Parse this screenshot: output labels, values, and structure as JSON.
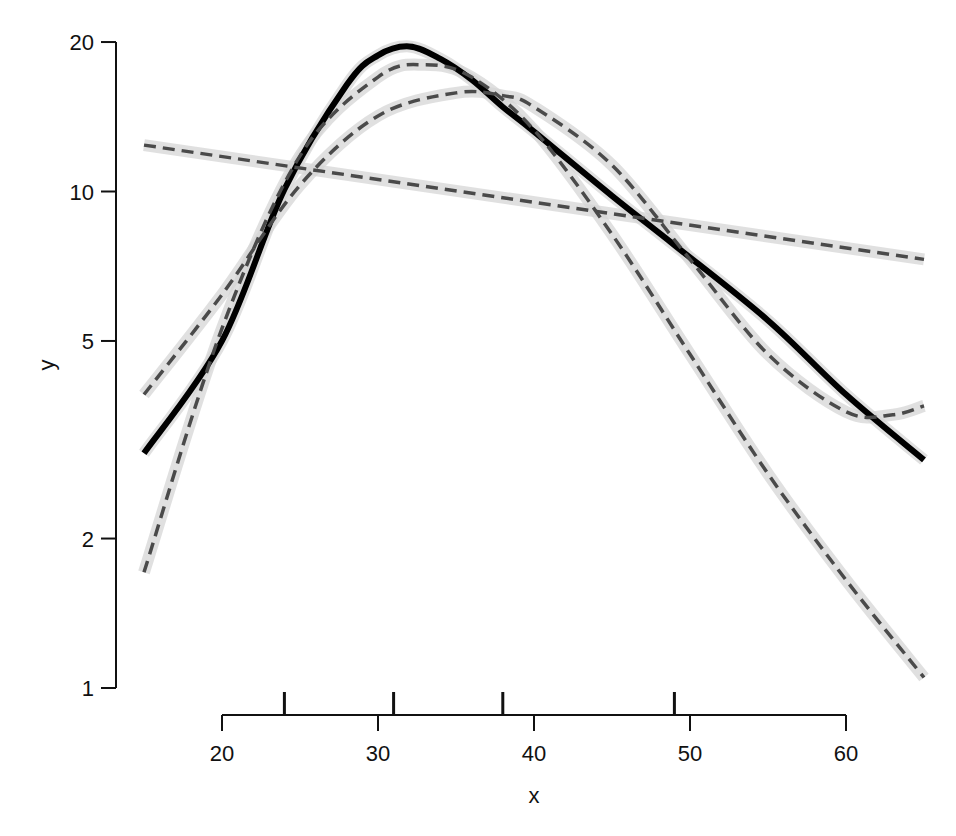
{
  "chart_data": {
    "type": "line",
    "title": "",
    "xlabel": "x",
    "ylabel": "y",
    "yscale": "log",
    "xlim": [
      15,
      65
    ],
    "ylim": [
      1,
      20
    ],
    "grid": false,
    "legend": null,
    "x_ticks": [
      20,
      30,
      40,
      50,
      60
    ],
    "y_ticks": [
      1,
      2,
      5,
      10,
      20
    ],
    "x_tick_labels": [
      "20",
      "30",
      "40",
      "50",
      "60"
    ],
    "y_tick_labels": [
      "1",
      "2",
      "5",
      "10",
      "20"
    ],
    "knot_marks": [
      24,
      31,
      38,
      49
    ],
    "series": [
      {
        "name": "spline (solid)",
        "style": "solid",
        "color": "#000000",
        "band": true,
        "x": [
          15,
          20,
          24,
          28,
          30,
          32,
          34,
          36,
          38,
          40,
          45,
          49,
          55,
          60,
          65
        ],
        "values": [
          2.97,
          5.0,
          10.1,
          16.4,
          18.8,
          19.6,
          18.5,
          16.8,
          14.8,
          13.2,
          9.8,
          7.8,
          5.5,
          3.9,
          2.88
        ]
      },
      {
        "name": "linear (dashed)",
        "style": "dashed",
        "color": "#4a4a4a",
        "band": true,
        "x": [
          15,
          65
        ],
        "values": [
          12.4,
          7.3
        ]
      },
      {
        "name": "quadratic (dashed)",
        "style": "dashed",
        "color": "#4a4a4a",
        "band": true,
        "x": [
          15,
          20,
          25,
          30,
          35,
          38,
          40,
          45,
          50,
          55,
          60,
          63,
          65
        ],
        "values": [
          3.9,
          6.2,
          10.3,
          14.2,
          15.8,
          15.6,
          14.8,
          11.3,
          7.3,
          4.7,
          3.6,
          3.55,
          3.7
        ]
      },
      {
        "name": "cubic (dashed)",
        "style": "dashed",
        "color": "#4a4a4a",
        "band": true,
        "x": [
          15,
          20,
          25,
          30,
          33,
          36,
          40,
          45,
          50,
          55,
          60,
          65
        ],
        "values": [
          1.71,
          5.3,
          11.8,
          17.0,
          18.0,
          17.0,
          13.3,
          8.2,
          4.7,
          2.7,
          1.65,
          1.05
        ]
      }
    ]
  }
}
